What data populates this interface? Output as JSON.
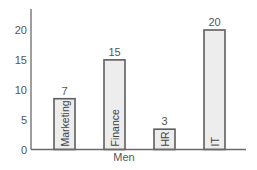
{
  "chart_data": {
    "type": "bar",
    "title": "",
    "xlabel": "Men",
    "ylabel": "",
    "categories": [
      "Marketing",
      "Finance",
      "HR",
      "IT"
    ],
    "values": [
      7,
      15,
      3,
      20
    ],
    "drawn_heights": [
      8.5,
      15,
      3.4,
      20
    ],
    "data_labels": [
      "7",
      "15",
      "3",
      "20"
    ],
    "ylim": [
      0,
      23.5
    ],
    "yticks": [
      0,
      5,
      10,
      15,
      20
    ],
    "ytick_labels": [
      "0",
      "5",
      "10",
      "15",
      "20"
    ],
    "grid": false,
    "legend": "none",
    "category_label_placement": "inside-bar-rotated",
    "bar_fill": "#ededed",
    "bar_edge": "#5e5e5e"
  }
}
